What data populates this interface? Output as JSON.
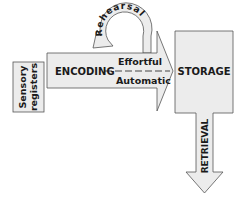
{
  "diagram": {
    "nodes": {
      "sensory": {
        "label_line1": "Sensory",
        "label_line2": "registers"
      },
      "storage": {
        "label": "STORAGE"
      }
    },
    "arrows": {
      "encoding": {
        "label": "ENCODING",
        "upper": "Effortful",
        "lower": "Automatic"
      },
      "rehearsal": {
        "label": "Rehearsal"
      },
      "retrieval": {
        "label": "RETRIEVAL"
      }
    },
    "colors": {
      "fill": "#ececec",
      "stroke": "#555555",
      "text": "#1a1a1a"
    }
  }
}
